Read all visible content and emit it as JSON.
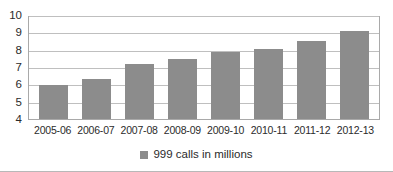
{
  "chart_data": {
    "type": "bar",
    "title": "",
    "subtitle": "",
    "xlabel": "",
    "ylabel": "",
    "categories": [
      "2005-06",
      "2006-07",
      "2007-08",
      "2008-09",
      "2009-10",
      "2010-11",
      "2011-12",
      "2012-13"
    ],
    "values": [
      5.98,
      6.3,
      7.2,
      7.45,
      7.85,
      8.05,
      8.5,
      9.1
    ],
    "series": [
      {
        "name": "999 calls in millions",
        "values": [
          5.98,
          6.3,
          7.2,
          7.45,
          7.85,
          8.05,
          8.5,
          9.1
        ],
        "color": "#8c8c8c"
      }
    ],
    "ylim": [
      4,
      10
    ],
    "y_ticks": [
      10,
      9,
      8,
      7,
      6,
      5,
      4
    ],
    "y_tick_labels": [
      "10",
      "9",
      "8",
      "7",
      "6",
      "5",
      "4"
    ],
    "grid": true,
    "grid_axis": "y",
    "legend_position": "bottom",
    "legend_entries": [
      {
        "label": "999 calls in millions",
        "color": "#8c8c8c",
        "marker": "square-swatch"
      }
    ]
  },
  "legend": {
    "label": "999 calls in millions"
  },
  "colors": {
    "bar_fill": "#8c8c8c",
    "gridline": "#bfbfbf",
    "axis_line": "#a9a9a9",
    "text": "#2b2b2b",
    "background": "#ffffff",
    "container_border": "#b8b8b8"
  }
}
